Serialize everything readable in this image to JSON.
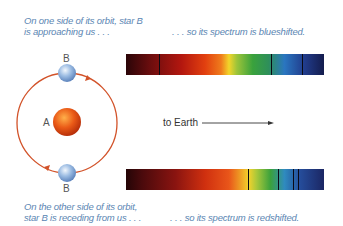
{
  "captions": {
    "top_left": [
      "On one side of its orbit, star B",
      "is approaching us . . ."
    ],
    "top_right": ". . . so its spectrum is blueshifted.",
    "bottom_left": [
      "On the other side of its orbit,",
      "star B is receding from us . . ."
    ],
    "bottom_right": ". . . so its spectrum is redshifted."
  },
  "labels": {
    "star_a": "A",
    "star_b_top": "B",
    "star_b_bottom": "B",
    "direction": "to Earth"
  },
  "spectra": {
    "blueshifted": {
      "lines_x": [
        33,
        145,
        176
      ]
    },
    "redshifted": {
      "lines_x": [
        122,
        152,
        167,
        172
      ]
    }
  },
  "colors": {
    "caption": "#5b86b3",
    "orbit": "#d2532a",
    "star_a": "#e8551a",
    "star_b": "#8fb3dd"
  }
}
